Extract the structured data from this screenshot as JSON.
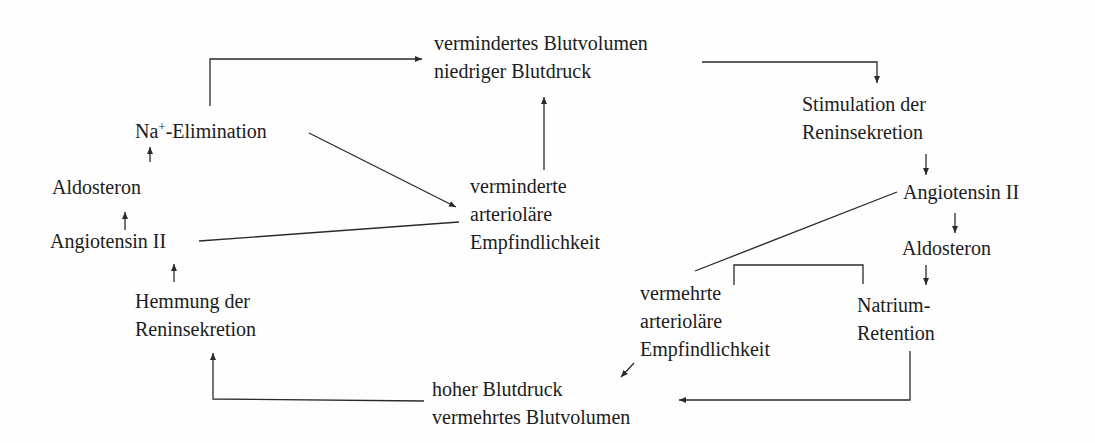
{
  "diagram": {
    "type": "feedback-loop-flowchart",
    "nodes": {
      "low_volume": {
        "lines": [
          "vermindertes Blutvolumen",
          "niedriger Blutdruck"
        ]
      },
      "stim_renin": {
        "lines": [
          "Stimulation der",
          "Reninsekretion"
        ]
      },
      "angiotensin_right": {
        "lines": [
          "Angiotensin II"
        ]
      },
      "aldosteron_right": {
        "lines": [
          "Aldosteron"
        ]
      },
      "natrium_retention": {
        "lines": [
          "Natrium-",
          "Retention"
        ]
      },
      "increased_sensitivity": {
        "lines": [
          "vermehrte",
          "arterioläre",
          "Empfindlichkeit"
        ]
      },
      "high_pressure": {
        "lines": [
          "hoher Blutdruck",
          "vermehrtes Blutvolumen"
        ]
      },
      "inhib_renin": {
        "lines": [
          "Hemmung der",
          "Reninsekretion"
        ]
      },
      "angiotensin_left": {
        "lines": [
          "Angiotensin II"
        ]
      },
      "aldosteron_left": {
        "lines": [
          "Aldosteron"
        ]
      },
      "na_elimination": {
        "prefix": "Na",
        "superscript": "+",
        "suffix": "-Elimination"
      },
      "decreased_sensitivity": {
        "lines": [
          "verminderte",
          "arterioläre",
          "Empfindlichkeit"
        ]
      }
    },
    "edges": [
      {
        "from": "low_volume",
        "to": "stim_renin",
        "arrow": true
      },
      {
        "from": "stim_renin",
        "to": "angiotensin_right",
        "arrow": true
      },
      {
        "from": "angiotensin_right",
        "to": "aldosteron_right",
        "arrow": true
      },
      {
        "from": "aldosteron_right",
        "to": "natrium_retention",
        "arrow": true
      },
      {
        "from": "angiotensin_right",
        "to": "increased_sensitivity",
        "arrow": false
      },
      {
        "from": "increased_sensitivity",
        "to": "natrium_retention",
        "arrow": false,
        "style": "bracket"
      },
      {
        "from": "increased_sensitivity",
        "to": "high_pressure",
        "arrow": true
      },
      {
        "from": "natrium_retention",
        "to": "high_pressure",
        "arrow": true
      },
      {
        "from": "high_pressure",
        "to": "inhib_renin",
        "arrow": true
      },
      {
        "from": "inhib_renin",
        "to": "angiotensin_left",
        "arrow": true
      },
      {
        "from": "angiotensin_left",
        "to": "aldosteron_left",
        "arrow": true
      },
      {
        "from": "aldosteron_left",
        "to": "na_elimination",
        "arrow": true
      },
      {
        "from": "na_elimination",
        "to": "low_volume",
        "arrow": true
      },
      {
        "from": "na_elimination",
        "to": "decreased_sensitivity",
        "arrow": true
      },
      {
        "from": "angiotensin_left",
        "to": "decreased_sensitivity",
        "arrow": false
      },
      {
        "from": "decreased_sensitivity",
        "to": "low_volume",
        "arrow": true
      }
    ]
  }
}
